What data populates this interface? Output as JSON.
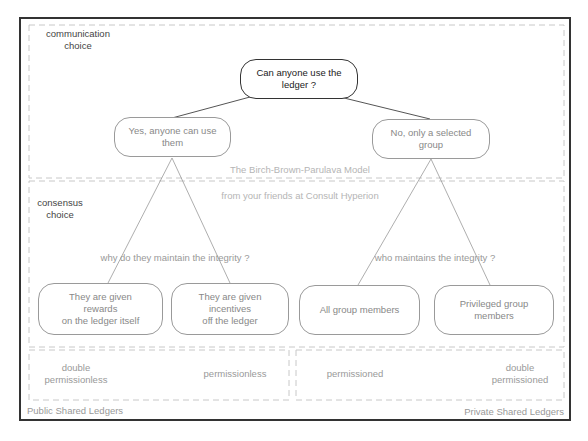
{
  "title": "The Birch-Brown-Parulava Model",
  "subtitle": "from your friends at Consult Hyperion",
  "sections": {
    "communication": "communication\nchoice",
    "consensus": "consensus\nchoice"
  },
  "root": {
    "label": "Can anyone use the\nledger ?"
  },
  "branches": {
    "public": {
      "label": "Yes, anyone can use\nthem"
    },
    "private": {
      "label": "No, only a selected\ngroup"
    }
  },
  "questions": {
    "public": "why do they maintain the integrity ?",
    "private": "who maintains the integrity ?"
  },
  "leaves": [
    {
      "label": "They are given\nrewards\non the ledger itself"
    },
    {
      "label": "They are given\nincentives\noff the ledger"
    },
    {
      "label": "All group members"
    },
    {
      "label": "Privileged group\nmembers"
    }
  ],
  "categories": [
    {
      "label": "double\npermissionless"
    },
    {
      "label": "permissionless"
    },
    {
      "label": "permissioned"
    },
    {
      "label": "double\npermissioned"
    }
  ],
  "footer": {
    "public": "Public Shared Ledgers",
    "private": "Private Shared Ledgers"
  },
  "colors": {
    "frame": "#333333",
    "dashed": "#c8c8c8",
    "text_dark": "#222222",
    "text_light": "#888888"
  }
}
